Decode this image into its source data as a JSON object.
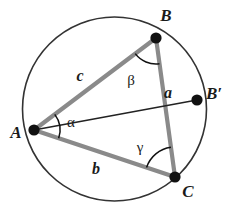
{
  "figure": {
    "background_color": "#ffffff",
    "circle_color": "#333333",
    "triangle_color": "#8a8a8a",
    "chord_color": "#222222",
    "vertex_color": "#111111",
    "arc_color": "#111111",
    "label_color": "#1a1a1a"
  },
  "circle": {
    "name": "circumcircle",
    "cx": 114.5,
    "cy": 109,
    "r": 92,
    "stroke_width": 1.6
  },
  "vertices": [
    {
      "id": "A",
      "label": "A",
      "x": 34,
      "y": 130,
      "label_x": 16,
      "label_y": 138,
      "dot_r": 5.6
    },
    {
      "id": "B",
      "label": "B",
      "x": 156,
      "y": 38,
      "label_x": 166,
      "label_y": 21,
      "dot_r": 5.6
    },
    {
      "id": "C",
      "label": "C",
      "x": 175,
      "y": 177,
      "label_x": 188,
      "label_y": 197,
      "dot_r": 5.6
    },
    {
      "id": "Bp",
      "label": "B′",
      "x": 197,
      "y": 100,
      "label_x": 206,
      "label_y": 99,
      "dot_r": 5.6
    }
  ],
  "sides": [
    {
      "id": "c",
      "label": "c",
      "from": "A",
      "to": "B",
      "label_x": 80,
      "label_y": 81,
      "stroke_width": 4.2
    },
    {
      "id": "a",
      "label": "a",
      "from": "B",
      "to": "C",
      "label_x": 168,
      "label_y": 98,
      "stroke_width": 4.2
    },
    {
      "id": "b",
      "label": "b",
      "from": "A",
      "to": "C",
      "label_x": 96,
      "label_y": 174,
      "stroke_width": 4.2
    }
  ],
  "chords": [
    {
      "id": "AB-prime",
      "label": "AB′",
      "from": "A",
      "to": "Bp",
      "stroke_width": 1.5
    }
  ],
  "angles": [
    {
      "id": "alpha",
      "label": "α",
      "at": "A",
      "label_x": 71,
      "label_y": 127,
      "arc_radius": 26
    },
    {
      "id": "beta",
      "label": "β",
      "at": "B",
      "label_x": 131,
      "label_y": 85,
      "arc_radius": 26
    },
    {
      "id": "gamma",
      "label": "γ",
      "at": "C",
      "label_x": 140,
      "label_y": 152,
      "arc_radius": 30
    }
  ]
}
